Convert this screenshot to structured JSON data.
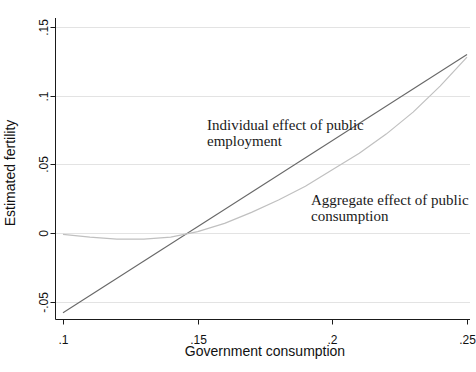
{
  "chart_data": {
    "type": "line",
    "title": "",
    "xlabel": "Government consumption",
    "ylabel": "Estimated fertility",
    "xlim": [
      0.1,
      0.25
    ],
    "ylim": [
      -0.063,
      0.157
    ],
    "grid": "horizontal",
    "legend": "none",
    "colors": {
      "individual_line": "#686868",
      "aggregate_line": "#c0c0c0",
      "gridline": "#e3e3e3",
      "axis": "#1a1a1a",
      "background": "#ffffff"
    },
    "xticks": {
      "values": [
        0.1,
        0.15,
        0.2,
        0.25
      ],
      "labels": [
        ".1",
        ".15",
        ".2",
        ".25"
      ]
    },
    "yticks": {
      "values": [
        -0.05,
        0,
        0.05,
        0.1,
        0.15
      ],
      "labels": [
        "-.05",
        "0",
        ".05",
        ".1",
        ".15"
      ]
    },
    "series": [
      {
        "name": "Individual effect of public employment",
        "color": "#686868",
        "width": 1.1,
        "x": [
          0.1,
          0.25
        ],
        "y": [
          -0.058,
          0.13
        ]
      },
      {
        "name": "Aggregate effect of public consumption",
        "color": "#c0c0c0",
        "width": 1.2,
        "x": [
          0.1,
          0.11,
          0.12,
          0.13,
          0.14,
          0.15,
          0.16,
          0.17,
          0.18,
          0.19,
          0.2,
          0.21,
          0.22,
          0.23,
          0.24,
          0.25
        ],
        "y": [
          -0.001,
          -0.003,
          -0.0045,
          -0.0045,
          -0.003,
          0.001,
          0.007,
          0.015,
          0.024,
          0.034,
          0.046,
          0.058,
          0.072,
          0.088,
          0.107,
          0.128
        ]
      }
    ],
    "annotations": [
      {
        "lines": [
          "Individual effect of public",
          "employment"
        ]
      },
      {
        "lines": [
          "Aggregate effect of public",
          "consumption"
        ]
      }
    ]
  }
}
